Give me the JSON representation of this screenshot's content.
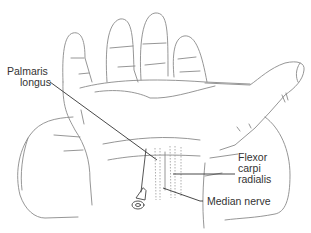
{
  "figure": {
    "labels": {
      "palmaris_longus_line1": "Palmaris",
      "palmaris_longus_line2": "longus",
      "flexor_line1": "Flexor",
      "flexor_line2": "carpi",
      "flexor_line3": "radialis",
      "median_nerve": "Median nerve"
    },
    "colors": {
      "outline": "#8a8a8a",
      "leader": "#333333",
      "text": "#333333",
      "background": "#ffffff"
    }
  }
}
